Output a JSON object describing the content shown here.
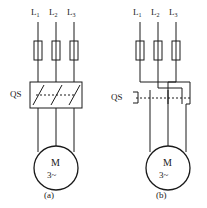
{
  "figure": {
    "type": "electrical-schematic",
    "stroke_color": "#1a1a1a",
    "background_color": "#ffffff"
  },
  "diagrams": [
    {
      "id": "a",
      "caption": "(a)",
      "phase_labels": [
        {
          "main": "L",
          "sub": "1"
        },
        {
          "main": "L",
          "sub": "2"
        },
        {
          "main": "L",
          "sub": "3"
        }
      ],
      "switch_label": "QS",
      "switch_style": "boxed-blades",
      "fuse_count": 3,
      "motor": {
        "letter": "M",
        "type": "3~"
      }
    },
    {
      "id": "b",
      "caption": "(b)",
      "phase_labels": [
        {
          "main": "L",
          "sub": "1"
        },
        {
          "main": "L",
          "sub": "2"
        },
        {
          "main": "L",
          "sub": "3"
        }
      ],
      "switch_label": "QS",
      "switch_style": "bracket-contacts",
      "fuse_count": 3,
      "motor": {
        "letter": "M",
        "type": "3~"
      }
    }
  ]
}
